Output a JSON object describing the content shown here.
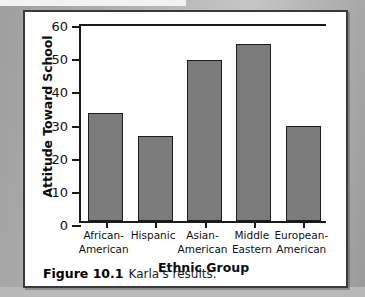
{
  "figure": {
    "caption_label": "Figure 10.1",
    "caption_text": "Karla's results."
  },
  "colors": {
    "bar_fill": "#7b7b7b",
    "bar_stroke": "#1c1c1c",
    "axis": "#1a1a1a",
    "panel_background": "#ffffff",
    "page_background": "#a9a9a9"
  },
  "chart_data": {
    "type": "bar",
    "title": "",
    "xlabel": "Ethnic Group",
    "ylabel": "Attitude Toward School",
    "categories": [
      "African-American",
      "Hispanic",
      "Asian-American",
      "Middle Eastern",
      "European-American"
    ],
    "category_lines": [
      [
        "African-",
        "American"
      ],
      [
        "Hispanic",
        ""
      ],
      [
        "Asian-",
        "American"
      ],
      [
        "Middle",
        "Eastern"
      ],
      [
        "European-",
        "American"
      ]
    ],
    "values": [
      32.5,
      25.5,
      48.5,
      53.5,
      28.5
    ],
    "ylim": [
      0,
      60
    ],
    "yticks": [
      0,
      10,
      20,
      30,
      40,
      50,
      60
    ],
    "ytick_labels": [
      "0",
      "10",
      "20",
      "30",
      "40",
      "50",
      "60"
    ],
    "grid": false,
    "legend": null
  }
}
